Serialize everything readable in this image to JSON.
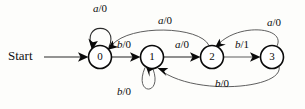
{
  "diagram": {
    "start_label": "Start",
    "states": [
      {
        "id": "s0",
        "label": "0",
        "cx": 100,
        "cy": 57,
        "r": 11.5
      },
      {
        "id": "s1",
        "label": "1",
        "cx": 152,
        "cy": 57,
        "r": 11.5
      },
      {
        "id": "s2",
        "label": "2",
        "cx": 212,
        "cy": 57,
        "r": 11.5
      },
      {
        "id": "s3",
        "label": "3",
        "cx": 272,
        "cy": 57,
        "r": 11.5
      }
    ],
    "transitions": [
      {
        "id": "t0",
        "from": "0",
        "to": "0",
        "input": "a",
        "output": "0",
        "label": "a/0",
        "label_x": 100,
        "label_y": 9,
        "kind": "self-loop-top"
      },
      {
        "id": "t1",
        "from": "0",
        "to": "1",
        "input": "b",
        "output": "0",
        "label": "b/0",
        "label_x": 124,
        "label_y": 45,
        "kind": "straight"
      },
      {
        "id": "t2",
        "from": "1",
        "to": "2",
        "input": "a",
        "output": "0",
        "label": "a/0",
        "label_x": 182,
        "label_y": 45,
        "kind": "straight"
      },
      {
        "id": "t3",
        "from": "2",
        "to": "3",
        "input": "b",
        "output": "1",
        "label": "b/1",
        "label_x": 242,
        "label_y": 45,
        "kind": "straight"
      },
      {
        "id": "t4",
        "from": "2",
        "to": "0",
        "input": "a",
        "output": "0",
        "label": "a/0",
        "label_x": 165,
        "label_y": 21,
        "kind": "arc-top-long"
      },
      {
        "id": "t5",
        "from": "3",
        "to": "2",
        "input": "a",
        "output": "0",
        "label": "a/0",
        "label_x": 274,
        "label_y": 23,
        "kind": "arc-top-short"
      },
      {
        "id": "t6",
        "from": "1",
        "to": "1",
        "input": "b",
        "output": "0",
        "label": "b/0",
        "label_x": 124,
        "label_y": 92,
        "kind": "self-loop-bottom"
      },
      {
        "id": "t7",
        "from": "3",
        "to": "1",
        "input": "b",
        "output": "0",
        "label": "b/0",
        "label_x": 222,
        "label_y": 84,
        "kind": "arc-bottom-long"
      }
    ],
    "colors": {
      "stroke": "#0a0a0a",
      "edge": "#2b2b2b",
      "text": "#0b0b0b",
      "background": "#fdfdfb"
    }
  }
}
